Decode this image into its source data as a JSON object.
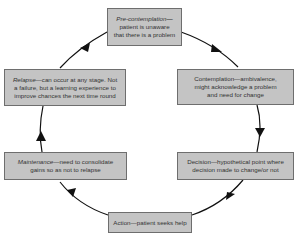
{
  "diagram": {
    "type": "cycle",
    "title": "",
    "stages": [
      {
        "id": "precontemplation",
        "term": "Pre-contemplation",
        "sep": "—",
        "desc": "patient is unaware that there is a problem",
        "line1_term": "Pre-contemplation—",
        "line2": "patient is unaware",
        "line3": "that there is a problem",
        "term_italic": true
      },
      {
        "id": "contemplation",
        "term": "Contemplation",
        "sep": "—",
        "desc": "ambivalence, might acknowledge a problem and need for change",
        "line1": "Contemplation—ambivalence,",
        "line2": "might acknowledge a problem",
        "line3": "and need for change",
        "term_italic": false
      },
      {
        "id": "decision",
        "term": "Decision",
        "sep": "—",
        "desc": "hypothetical point where decision made to change/or not",
        "line1": "Decision—hypothetical point where",
        "line2": "decision made to change/or not",
        "term_italic": false
      },
      {
        "id": "action",
        "term": "Action",
        "sep": "—",
        "desc": "patient seeks help",
        "line1": "Action—patient seeks help",
        "term_italic": false
      },
      {
        "id": "maintenance",
        "term": "Maintenance",
        "sep": "—",
        "desc": "need to consolidate gains so as not to relapse",
        "line1_term": "Maintenance",
        "line1_rest": "—need to consolidate",
        "line2": "gains so as not to relapse",
        "term_italic": true
      },
      {
        "id": "relapse",
        "term": "Relapse",
        "sep": "—",
        "desc": "can occur at any stage. Not a failure, but a learning experience to improve chances the next time round",
        "line1_term": "Relapse",
        "line1_rest": "—can occur at any stage. Not",
        "line2": "a failure, but a learning experience to",
        "line3": "improve chances the next time round",
        "term_italic": true
      }
    ],
    "flow": [
      "precontemplation",
      "contemplation",
      "decision",
      "action",
      "maintenance",
      "relapse",
      "precontemplation"
    ],
    "colors": {
      "box_fill": "#c4c4c4",
      "box_border": "#6e6e6e",
      "arrow": "#111111",
      "text": "#333333"
    }
  }
}
